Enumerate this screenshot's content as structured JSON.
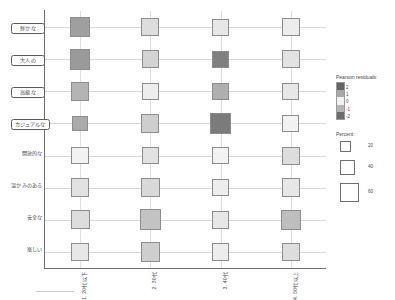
{
  "chart_data": {
    "type": "heatmap",
    "title": "",
    "xlabel": "",
    "ylabel": "",
    "grid": true,
    "legend_position": "right",
    "categories": [
      "1. 20代以下",
      "2. 30代",
      "3. 40代",
      "4. 50代以上"
    ],
    "rows": [
      "鮮かな",
      "大人の",
      "高級な",
      "カジュアルな",
      "開放的な",
      "温かみのある",
      "安全な",
      "楽しい"
    ],
    "row_boxed": [
      true,
      true,
      true,
      true,
      false,
      false,
      false,
      false
    ],
    "series": [
      {
        "name": "鮮かな",
        "cells": [
          {
            "category": "1. 20代以下",
            "residual": 1.8,
            "percent": 46
          },
          {
            "category": "2. 30代",
            "residual": -0.6,
            "percent": 40
          },
          {
            "category": "3. 40代",
            "residual": 0.4,
            "percent": 36
          },
          {
            "category": "4. 50代以上",
            "residual": -0.3,
            "percent": 38
          }
        ]
      },
      {
        "name": "大人の",
        "cells": [
          {
            "category": "1. 20代以下",
            "residual": 1.9,
            "percent": 50
          },
          {
            "category": "2. 30代",
            "residual": -0.8,
            "percent": 38
          },
          {
            "category": "3. 40代",
            "residual": 2.4,
            "percent": 36
          },
          {
            "category": "4. 50代以上",
            "residual": -0.5,
            "percent": 38
          }
        ]
      },
      {
        "name": "高級な",
        "cells": [
          {
            "category": "1. 20代以下",
            "residual": 1.4,
            "percent": 42
          },
          {
            "category": "2. 30代",
            "residual": 0.3,
            "percent": 34
          },
          {
            "category": "3. 40代",
            "residual": 1.5,
            "percent": 34
          },
          {
            "category": "4. 50代以上",
            "residual": -0.4,
            "percent": 36
          }
        ]
      },
      {
        "name": "カジュアルな",
        "cells": [
          {
            "category": "1. 20代以下",
            "residual": 1.6,
            "percent": 30
          },
          {
            "category": "2. 30代",
            "residual": 0.9,
            "percent": 40
          },
          {
            "category": "3. 40代",
            "residual": 2.5,
            "percent": 50
          },
          {
            "category": "4. 50代以上",
            "residual": 0.2,
            "percent": 36
          }
        ]
      },
      {
        "name": "開放的な",
        "cells": [
          {
            "category": "1. 20代以下",
            "residual": 0.2,
            "percent": 38
          },
          {
            "category": "2. 30代",
            "residual": 0.5,
            "percent": 36
          },
          {
            "category": "3. 40代",
            "residual": -0.2,
            "percent": 34
          },
          {
            "category": "4. 50代以上",
            "residual": 0.6,
            "percent": 40
          }
        ]
      },
      {
        "name": "温かみのある",
        "cells": [
          {
            "category": "1. 20代以下",
            "residual": 0.5,
            "percent": 42
          },
          {
            "category": "2. 30代",
            "residual": -0.7,
            "percent": 42
          },
          {
            "category": "3. 40代",
            "residual": 0.3,
            "percent": 38
          },
          {
            "category": "4. 50代以上",
            "residual": 0.4,
            "percent": 42
          }
        ]
      },
      {
        "name": "安全な",
        "cells": [
          {
            "category": "1. 20代以下",
            "residual": 0.6,
            "percent": 44
          },
          {
            "category": "2. 30代",
            "residual": 1.1,
            "percent": 50
          },
          {
            "category": "3. 40代",
            "residual": -0.4,
            "percent": 38
          },
          {
            "category": "4. 50代以上",
            "residual": 1.2,
            "percent": 48
          }
        ]
      },
      {
        "name": "楽しい",
        "cells": [
          {
            "category": "1. 20代以下",
            "residual": 0.4,
            "percent": 42
          },
          {
            "category": "2. 30代",
            "residual": 0.9,
            "percent": 46
          },
          {
            "category": "3. 40代",
            "residual": 0.3,
            "percent": 38
          },
          {
            "category": "4. 50代以上",
            "residual": -0.6,
            "percent": 40
          }
        ]
      }
    ]
  },
  "legend": {
    "residuals": {
      "title": "Pearson residuals:",
      "ticks": [
        "2",
        "1",
        "0",
        "-1",
        "-2"
      ],
      "colors": [
        "#636363",
        "#a8a8a8",
        "#f2f2f2",
        "#b5b5b5",
        "#6b6b6b"
      ]
    },
    "percent": {
      "title": "Percent:",
      "values": [
        "20",
        "40",
        "60"
      ]
    }
  },
  "colors": {
    "axis": "#6e6e6e",
    "gridline": "#d9d9d9",
    "cell_border": "#8c8c8c",
    "text": "#4a4a4a"
  }
}
